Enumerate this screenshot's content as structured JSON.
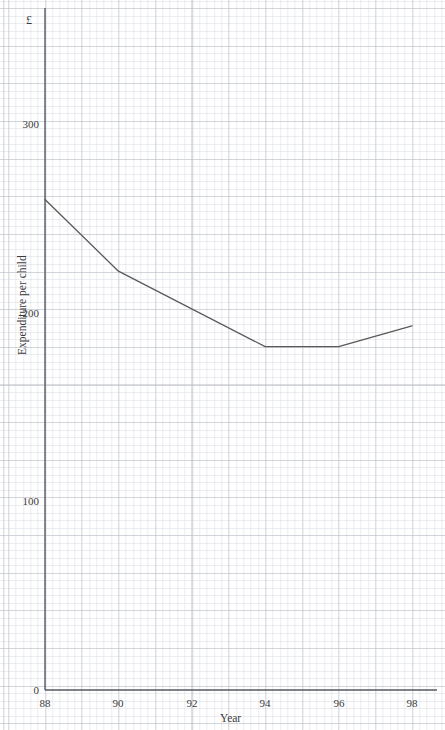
{
  "chart_data": {
    "type": "line",
    "title": "",
    "subtitle": "",
    "xlabel": "Year",
    "ylabel": "Expenditure per child",
    "yunit": "£",
    "xlim": [
      88,
      98
    ],
    "ylim": [
      0,
      330
    ],
    "xtick_labels": [
      "88",
      "90",
      "92",
      "94",
      "96",
      "98"
    ],
    "xticks": [
      88,
      90,
      92,
      94,
      96,
      98
    ],
    "ytick_labels": [
      "0",
      "100",
      "200",
      "300"
    ],
    "yticks": [
      0,
      100,
      200,
      300
    ],
    "grid": "graph-paper",
    "legend": "none",
    "series": [
      {
        "name": "Expenditure per child",
        "color": "#595959",
        "x": [
          88,
          90,
          94,
          96,
          98
        ],
        "values": [
          260,
          222,
          182,
          182,
          193
        ]
      }
    ]
  },
  "axes": {
    "y_unit_symbol": "£",
    "y_axis_title": "Expenditure per child",
    "x_axis_title": "Year",
    "y_ticks": [
      {
        "label": "300",
        "value": 300
      },
      {
        "label": "200",
        "value": 200
      },
      {
        "label": "100",
        "value": 100
      },
      {
        "label": "0",
        "value": 0
      }
    ],
    "x_ticks": [
      {
        "label": "88",
        "value": 88
      },
      {
        "label": "90",
        "value": 90
      },
      {
        "label": "92",
        "value": 92
      },
      {
        "label": "94",
        "value": 94
      },
      {
        "label": "96",
        "value": 96
      },
      {
        "label": "98",
        "value": 98
      }
    ]
  },
  "colors": {
    "axis": "#555a60",
    "series": "#595959",
    "grid_major": "#969ba5",
    "grid_minor": "#b2b8c4",
    "text": "#3b3b3b"
  }
}
